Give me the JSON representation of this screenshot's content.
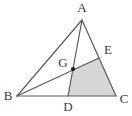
{
  "figure": {
    "type": "geometric-diagram",
    "canvas": {
      "width": 132,
      "height": 116
    },
    "style": {
      "stroke_color": "#5a5a5a",
      "stroke_width": 1.2,
      "shade_fill": "#d6d6d6",
      "shade_stroke": "#6a6a6a",
      "label_color": "#3a3a3a",
      "point_color": "#1c1c1c",
      "background": "#ffffff"
    },
    "points": [
      {
        "id": "A",
        "label": "A",
        "x": 82,
        "y": 20,
        "label_x": 82,
        "label_y": 9,
        "marked": false
      },
      {
        "id": "B",
        "label": "B",
        "x": 17,
        "y": 96,
        "label_x": 8,
        "label_y": 97,
        "marked": false
      },
      {
        "id": "C",
        "label": "C",
        "x": 116,
        "y": 96,
        "label_x": 124,
        "label_y": 100,
        "marked": false
      },
      {
        "id": "D",
        "label": "D",
        "x": 68,
        "y": 96,
        "label_x": 68,
        "label_y": 108,
        "marked": false
      },
      {
        "id": "E",
        "label": "E",
        "x": 99,
        "y": 58,
        "label_x": 108,
        "label_y": 51,
        "marked": false
      },
      {
        "id": "G",
        "label": "G",
        "x": 73,
        "y": 69,
        "label_x": 63,
        "label_y": 64,
        "marked": true
      }
    ],
    "segments": [
      {
        "id": "AB",
        "from": "A",
        "to": "B",
        "name": "side-ab"
      },
      {
        "id": "BC",
        "from": "B",
        "to": "C",
        "name": "side-bc"
      },
      {
        "id": "AC",
        "from": "A",
        "to": "C",
        "name": "side-ac"
      },
      {
        "id": "AD",
        "from": "A",
        "to": "D",
        "name": "cevian-ad"
      },
      {
        "id": "BE",
        "from": "B",
        "to": "E",
        "name": "cevian-be"
      }
    ],
    "shaded_regions": [
      {
        "id": "GDCE",
        "name": "shaded-quadrilateral-gdce",
        "vertices": [
          "G",
          "D",
          "C",
          "E"
        ],
        "fill": "#d6d6d6"
      }
    ],
    "labels": {
      "A": "A",
      "B": "B",
      "C": "C",
      "D": "D",
      "E": "E",
      "G": "G"
    }
  }
}
